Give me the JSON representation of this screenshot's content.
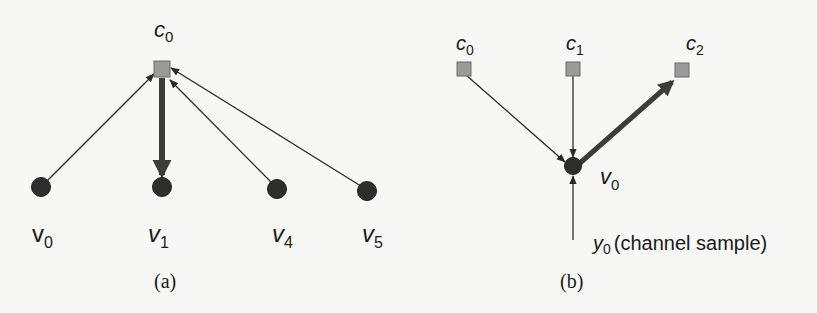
{
  "figure": {
    "panels": [
      {
        "id": "a",
        "caption": "(a)",
        "check_nodes": [
          {
            "id": "c0",
            "label": "c",
            "sub": "0",
            "x": 162,
            "y": 70
          }
        ],
        "variable_nodes": [
          {
            "id": "v0",
            "label": "v",
            "sub": "0",
            "x": 41,
            "y": 187
          },
          {
            "id": "v1",
            "label": "v",
            "sub": "1",
            "x": 162,
            "y": 187
          },
          {
            "id": "v4",
            "label": "v",
            "sub": "4",
            "x": 277,
            "y": 188
          },
          {
            "id": "v5",
            "label": "v",
            "sub": "5",
            "x": 367,
            "y": 190
          }
        ],
        "edges": [
          {
            "from": "v0",
            "to": "c0",
            "style": "thin"
          },
          {
            "from": "c0",
            "to": "v1",
            "style": "thick"
          },
          {
            "from": "v4",
            "to": "c0",
            "style": "thin"
          },
          {
            "from": "v5",
            "to": "c0",
            "style": "thin"
          }
        ]
      },
      {
        "id": "b",
        "caption": "(b)",
        "check_nodes": [
          {
            "id": "c0",
            "label": "c",
            "sub": "0",
            "x": 464,
            "y": 68
          },
          {
            "id": "c1",
            "label": "c",
            "sub": "1",
            "x": 573,
            "y": 68
          },
          {
            "id": "c2",
            "label": "c",
            "sub": "2",
            "x": 682,
            "y": 70
          }
        ],
        "variable_nodes": [
          {
            "id": "v0",
            "label": "v",
            "sub": "0",
            "x": 573,
            "y": 166
          }
        ],
        "edges": [
          {
            "from": "c0",
            "to": "v0",
            "style": "thin"
          },
          {
            "from": "c1",
            "to": "v0",
            "style": "thin"
          },
          {
            "from": "v0",
            "to": "c2",
            "style": "thick"
          },
          {
            "from": "y0",
            "to": "v0",
            "style": "thin"
          }
        ],
        "channel_input": {
          "label": "y",
          "sub": "0",
          "text": "(channel sample)"
        }
      }
    ],
    "colors": {
      "check_fill": "#9a9a9a",
      "check_stroke": "#6a6a6a",
      "variable_fill": "#2e2e2e",
      "edge": "#2a2a2a",
      "thick_edge": "#3c3c3c"
    }
  }
}
